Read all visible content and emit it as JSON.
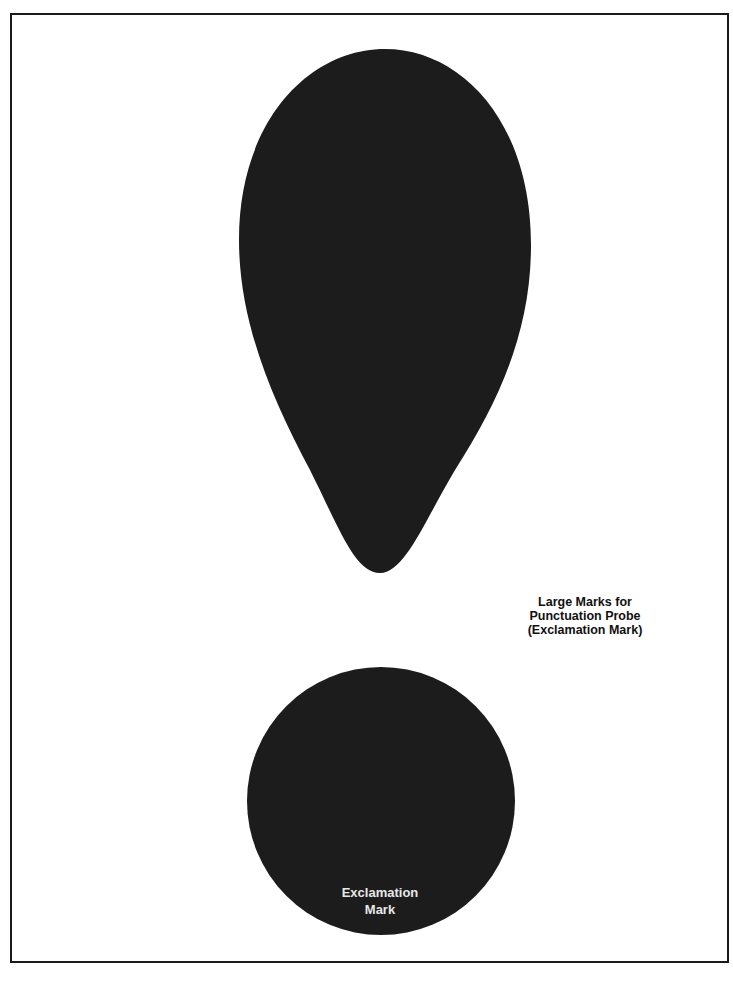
{
  "document": {
    "title_lines": [
      "Large Marks for",
      "Punctuation Probe",
      "(Exclamation Mark)"
    ],
    "caption_lines": [
      "Exclamation",
      "Mark"
    ]
  },
  "shapes": {
    "drop": {
      "description": "upper stroke of exclamation mark (teardrop)",
      "fill": "#1c1c1c"
    },
    "dot": {
      "description": "dot of exclamation mark (circle)",
      "fill": "#1c1c1c"
    }
  },
  "colors": {
    "ink": "#1c1c1c",
    "caption_text": "#e8e8e8",
    "background": "#ffffff",
    "frame": "#1a1a1a"
  }
}
